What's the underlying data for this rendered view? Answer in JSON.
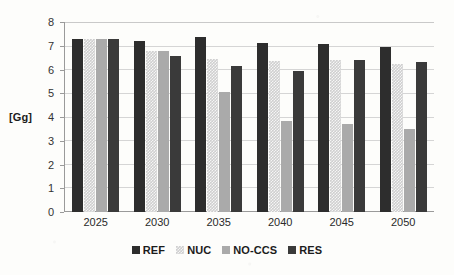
{
  "chart_data": {
    "type": "bar",
    "title": "",
    "xlabel": "",
    "ylabel": "[Gg]",
    "ylim": [
      0,
      8
    ],
    "ytick_step": 1,
    "yticks": [
      "8",
      "7",
      "6",
      "5",
      "4",
      "3",
      "2",
      "1",
      "0"
    ],
    "grid": "horizontal",
    "legend_position": "bottom",
    "categories": [
      "2025",
      "2030",
      "2035",
      "2040",
      "2045",
      "2050"
    ],
    "series": [
      {
        "name": "REF",
        "color": "#2d2d2d",
        "values": [
          7.28,
          7.18,
          7.38,
          7.1,
          7.08,
          6.95
        ]
      },
      {
        "name": "NUC",
        "color": "#cfcfcf",
        "values": [
          7.28,
          6.78,
          6.45,
          6.35,
          6.4,
          6.25
        ]
      },
      {
        "name": "NO-CCS",
        "color": "#aaaaaa",
        "values": [
          7.28,
          6.78,
          5.05,
          3.85,
          3.7,
          3.5
        ]
      },
      {
        "name": "RES",
        "color": "#3a3a3a",
        "values": [
          7.28,
          6.57,
          6.15,
          5.95,
          6.42,
          6.3
        ]
      }
    ]
  },
  "colors": {
    "axis": "#9a9a9a",
    "gridline": "#d5d5d5",
    "text": "#1c1c1c",
    "background": "#fdfdfb"
  }
}
